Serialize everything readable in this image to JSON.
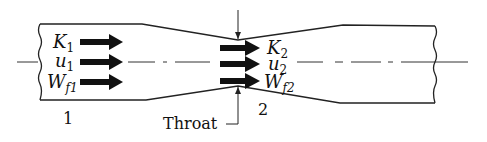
{
  "diagram": {
    "type": "venturi-nozzle-cross-section",
    "colors": {
      "stroke": "#222222",
      "arrow": "#111111",
      "background": "#ffffff"
    },
    "section1": {
      "label": "1",
      "quantities": [
        {
          "symbol": "K",
          "sub": "1"
        },
        {
          "symbol": "u",
          "sub": "1"
        },
        {
          "symbol": "W",
          "sub": "f1"
        }
      ]
    },
    "section2": {
      "label": "2",
      "quantities": [
        {
          "symbol": "K",
          "sub": "2"
        },
        {
          "symbol": "u",
          "sub": "2"
        },
        {
          "symbol": "W",
          "sub": "f2"
        }
      ]
    },
    "throat_label": "Throat"
  }
}
